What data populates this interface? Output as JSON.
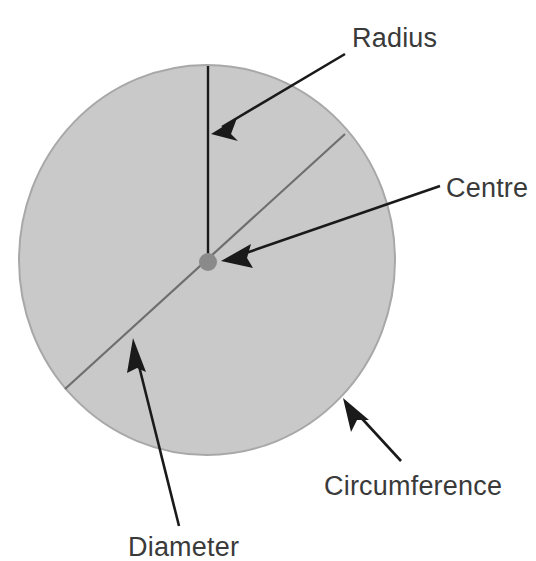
{
  "diagram": {
    "type": "geometry-annotated-circle",
    "background_color": "#ffffff",
    "shape": {
      "name": "circle",
      "fill_color": "#c9c9c9",
      "stroke_color": "#a8a8a8",
      "center_x": 207,
      "center_y": 260,
      "radius_x": 188,
      "radius_y": 195
    },
    "centre_dot": {
      "name": "centre-point",
      "x": 208,
      "y": 262,
      "radius": 9,
      "color": "#8a8a8a"
    },
    "lines": [
      {
        "name": "radius-line",
        "x1": 208,
        "y1": 66,
        "x2": 208,
        "y2": 262,
        "color": "#1a1a1a",
        "width": 2.4
      },
      {
        "name": "diameter-line",
        "x1": 345,
        "y1": 134,
        "x2": 65,
        "y2": 389,
        "color": "#6e6e6e",
        "width": 2.2
      }
    ],
    "annotations": [
      {
        "id": "radius",
        "label": "Radius",
        "label_x": 352,
        "label_y": 47,
        "anchor": "start",
        "arrow_from_x": 345,
        "arrow_from_y": 54,
        "arrow_to_x": 211,
        "arrow_to_y": 134,
        "color": "#1a1a1a"
      },
      {
        "id": "centre",
        "label": "Centre",
        "label_x": 446,
        "label_y": 197,
        "anchor": "start",
        "arrow_from_x": 440,
        "arrow_from_y": 186,
        "arrow_to_x": 221,
        "arrow_to_y": 261,
        "color": "#1a1a1a"
      },
      {
        "id": "circumference",
        "label": "Circumference",
        "label_x": 324,
        "label_y": 495,
        "anchor": "start",
        "arrow_from_x": 401,
        "arrow_from_y": 461,
        "arrow_to_x": 343,
        "arrow_to_y": 398,
        "color": "#1a1a1a"
      },
      {
        "id": "diameter",
        "label": "Diameter",
        "label_x": 128,
        "label_y": 556,
        "anchor": "start",
        "arrow_from_x": 179,
        "arrow_from_y": 526,
        "arrow_to_x": 133,
        "arrow_to_y": 338,
        "color": "#1a1a1a"
      }
    ]
  }
}
